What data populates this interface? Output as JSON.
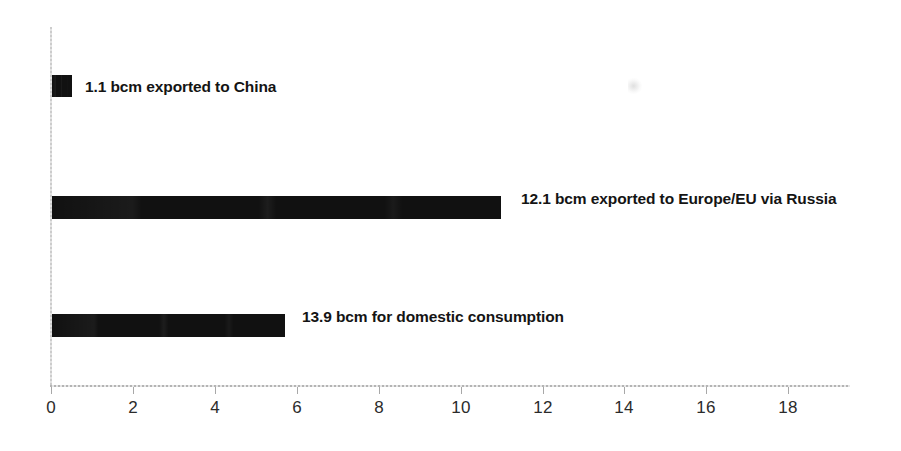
{
  "chart_data": {
    "type": "bar",
    "orientation": "horizontal",
    "title": "",
    "subtitle": "",
    "xlabel": "",
    "ylabel": "",
    "xlim": [
      0,
      19.5
    ],
    "grid": false,
    "legend": "none",
    "unit": "bcm",
    "categories": [
      "exported to China",
      "exported to Europe/EU via Russia",
      "for domestic consumption"
    ],
    "values": [
      1.1,
      12.1,
      13.9
    ],
    "drawn_bar_lengths": [
      0.5,
      11.0,
      5.7
    ],
    "annotations": [
      "1.1 bcm exported to China",
      "12.1 bcm exported to Europe/EU via Russia",
      "13.9 bcm for domestic consumption"
    ],
    "xticks": [
      0,
      2,
      4,
      6,
      8,
      10,
      12,
      14,
      16,
      18
    ],
    "xtick_labels": [
      "0",
      "2",
      "4",
      "6",
      "8",
      "10",
      "12",
      "14",
      "16",
      "18"
    ],
    "colors": {
      "bar": "#111111",
      "axis": "#b4b4b4",
      "text": "#141414",
      "background": "#ffffff"
    }
  },
  "bars": [
    {
      "label": "1.1 bcm exported to China",
      "value": 1.1,
      "pixel_left": 52,
      "pixel_top": 75,
      "pixel_width": 20,
      "pixel_height": 22,
      "label_left": 85,
      "label_top": 78
    },
    {
      "label": "12.1 bcm exported to Europe/EU via Russia",
      "value": 12.1,
      "pixel_left": 52,
      "pixel_top": 196,
      "pixel_width": 449,
      "pixel_height": 23,
      "label_left": 521,
      "label_top": 190
    },
    {
      "label": "13.9 bcm for domestic consumption",
      "value": 13.9,
      "pixel_left": 52,
      "pixel_top": 314,
      "pixel_width": 233,
      "pixel_height": 23,
      "label_left": 302,
      "label_top": 308
    }
  ],
  "axis": {
    "origin_x": 51,
    "px_per_unit": 40.9,
    "baseline_y": 385,
    "ticks": [
      {
        "label": "0",
        "x": 51
      },
      {
        "label": "2",
        "x": 133
      },
      {
        "label": "4",
        "x": 215
      },
      {
        "label": "6",
        "x": 297
      },
      {
        "label": "8",
        "x": 379
      },
      {
        "label": "10",
        "x": 461
      },
      {
        "label": "12",
        "x": 543
      },
      {
        "label": "14",
        "x": 624
      },
      {
        "label": "16",
        "x": 706
      },
      {
        "label": "18",
        "x": 788
      }
    ]
  }
}
